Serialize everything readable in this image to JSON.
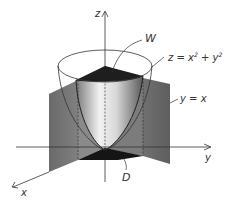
{
  "diagram": {
    "type": "3d-region",
    "axes": {
      "x": "x",
      "y": "y",
      "z": "z"
    },
    "labels": {
      "region": "W",
      "surface": "z = x",
      "surface_sup1": "2",
      "surface_mid": " + y",
      "surface_sup2": "2",
      "plane": "y = x",
      "base": "D"
    },
    "colors": {
      "plane_fill": "#6e6e6e",
      "plane_dark": "#4a4a4a",
      "cap_fill": "#1e1e1e",
      "paraboloid_light": "#f4f4f4",
      "paraboloid_dark": "#6a6a6a",
      "line": "#333333"
    }
  }
}
